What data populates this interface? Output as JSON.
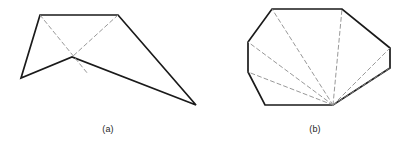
{
  "figure": {
    "background_color": "#ffffff",
    "outline_color": "#1a1a1a",
    "diagonal_color": "#8c8c8c",
    "outline_width": 1.7,
    "diagonal_width": 0.9,
    "diagonal_dash": "4,3",
    "caption_color": "#262626"
  },
  "panels": [
    {
      "id": "a",
      "caption": "(a)",
      "name": "polygon-panel-a",
      "description": "simple non-convex polygon with two dashed diagonals",
      "vertex_count": 5,
      "polygon_points": "40,15 118,15 196,105 72,57 21,78",
      "diagonals": [
        {
          "name": "diagonal-a-1",
          "points": "40,15 88,74"
        },
        {
          "name": "diagonal-a-2",
          "points": "118,15 72,57"
        }
      ]
    },
    {
      "id": "b",
      "caption": "(b)",
      "name": "polygon-panel-b",
      "description": "convex octagon fan-triangulated from the bottom-right vertex",
      "vertex_count": 8,
      "polygon_points": "272,9 342,9 390,48 390,68 333,105 265,105 248,72 248,42",
      "fan_apex": "333,105",
      "diagonals": [
        {
          "name": "diagonal-b-1",
          "points": "333,105 272,9"
        },
        {
          "name": "diagonal-b-2",
          "points": "333,105 342,9"
        },
        {
          "name": "diagonal-b-3",
          "points": "333,105 248,42"
        },
        {
          "name": "diagonal-b-4",
          "points": "333,105 248,72"
        },
        {
          "name": "diagonal-b-5",
          "points": "333,105 390,48"
        },
        {
          "name": "diagonal-b-6",
          "points": "333,105 390,68"
        }
      ]
    }
  ]
}
